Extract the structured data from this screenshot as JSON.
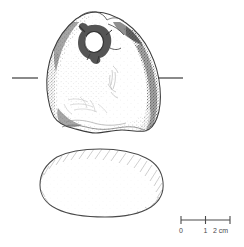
{
  "figure": {
    "type": "archaeological-line-drawing",
    "background_color": "#ffffff",
    "ink_color": "#3c3c3c",
    "views": [
      {
        "name": "front-elevation",
        "label": "",
        "has_perforation": true
      },
      {
        "name": "cross-section",
        "label": "",
        "has_perforation": false
      }
    ]
  },
  "section_marks": {
    "left_tick_label": "",
    "right_tick_label": ""
  },
  "scale_bar": {
    "unit": "cm",
    "ticks": [
      {
        "label": "0",
        "value": 0
      },
      {
        "label": "1",
        "value": 1
      },
      {
        "label": "2",
        "value": 2
      }
    ],
    "end_label": "2 cm",
    "start_label": "0",
    "mid_label": "1",
    "unit_label": "cm",
    "color": "#4a4a4a"
  }
}
